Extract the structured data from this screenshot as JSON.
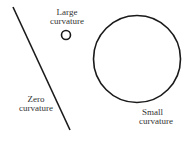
{
  "labels": {
    "large": [
      "Large",
      "curvature"
    ],
    "zero": [
      "Zero",
      "curvature"
    ],
    "small": [
      "Small",
      "curvature"
    ]
  },
  "colors": {
    "stroke": "#1a1a1a",
    "text": "#333333"
  }
}
